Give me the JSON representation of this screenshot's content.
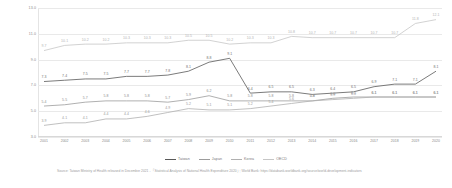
{
  "chart_data": {
    "type": "line",
    "title": "",
    "subtitle": "",
    "xlabel": "",
    "ylabel": "",
    "ylim": [
      3.0,
      13.0
    ],
    "yticks": [
      "3.0",
      "5.0",
      "7.0",
      "9.0",
      "11.0",
      "13.0"
    ],
    "grid": true,
    "legend_position": "bottom-center",
    "categories": [
      "2001",
      "2002",
      "2003",
      "2004",
      "2005",
      "2006",
      "2007",
      "2008",
      "2009",
      "2010",
      "2011",
      "2012",
      "2013",
      "2014",
      "2015",
      "2016",
      "2017",
      "2018",
      "2019",
      "2020"
    ],
    "series": [
      {
        "name": "Taiwan",
        "color": "#595959",
        "values": [
          7.3,
          7.4,
          7.5,
          7.5,
          7.7,
          7.7,
          7.8,
          8.1,
          8.8,
          9.1,
          6.4,
          6.5,
          6.5,
          6.3,
          6.4,
          6.5,
          6.9,
          7.1,
          7.1,
          8.1
        ]
      },
      {
        "name": "Japan",
        "color": "#9c9c9c",
        "values": [
          5.4,
          5.5,
          5.7,
          5.8,
          5.8,
          5.8,
          5.7,
          5.9,
          6.2,
          5.8,
          5.8,
          5.8,
          5.8,
          5.8,
          6.0,
          6.1,
          6.1,
          6.1,
          6.1,
          6.1
        ]
      },
      {
        "name": "Korea",
        "color": "#b0b0b0",
        "values": [
          3.9,
          4.1,
          4.1,
          4.4,
          4.4,
          4.6,
          4.9,
          5.2,
          5.1,
          5.1,
          5.2,
          5.4,
          5.6,
          5.8,
          5.9,
          6.0,
          6.1,
          6.1,
          6.1,
          6.1
        ]
      },
      {
        "name": "OECD",
        "color": "#c6c6c6",
        "values": [
          9.7,
          10.1,
          10.2,
          10.2,
          10.3,
          10.3,
          10.3,
          10.5,
          10.5,
          10.2,
          10.3,
          10.3,
          10.8,
          10.7,
          10.7,
          10.7,
          10.7,
          10.7,
          11.8,
          12.1
        ]
      }
    ],
    "point_labels": {
      "Taiwan": [
        "7.3",
        "7.4",
        "7.5",
        "7.5",
        "7.7",
        "7.7",
        "7.8",
        "8.1",
        "8.8",
        "9.1",
        "6.4",
        "6.5",
        "6.5",
        "6.3",
        "6.4",
        "6.5",
        "6.9",
        "7.1",
        "7.1",
        "8.1"
      ],
      "Japan": [
        "5.4",
        "5.5",
        "5.7",
        "5.8",
        "5.8",
        "5.8",
        "5.7",
        "5.9",
        "6.2",
        "5.8",
        "5.8",
        "5.8",
        "5.8",
        "5.8",
        "6.0",
        "6.1",
        "6.1",
        "6.1",
        "6.1",
        "6.1"
      ],
      "Korea": [
        "3.9",
        "4.1",
        "4.1",
        "4.4",
        "4.4",
        "4.6",
        "4.9",
        "5.2",
        "5.1",
        "5.1",
        "5.2",
        "5.4",
        "5.6",
        "5.8",
        "5.9",
        "6.0",
        "6.1",
        "6.1",
        "6.1",
        "6.1"
      ],
      "OECD": [
        "9.7",
        "10.1",
        "10.2",
        "10.2",
        "10.3",
        "10.3",
        "10.3",
        "10.5",
        "10.5",
        "10.2",
        "10.3",
        "10.3",
        "10.8",
        "10.7",
        "10.7",
        "10.7",
        "10.7",
        "10.7",
        "11.8",
        "12.1"
      ]
    }
  },
  "legend": {
    "items": [
      {
        "label": "Taiwan",
        "color": "#595959"
      },
      {
        "label": "Japan",
        "color": "#9c9c9c"
      },
      {
        "label": "Korea",
        "color": "#b0b0b0"
      },
      {
        "label": "OECD",
        "color": "#c6c6c6"
      }
    ]
  },
  "source": {
    "text": "Source: Taiwan Ministry of Health released in December 2021 - 「Statistical Analysis of National Health Expenditure 2020」; World Bank: https://databank.worldbank.org/source/world-development-indicators"
  }
}
